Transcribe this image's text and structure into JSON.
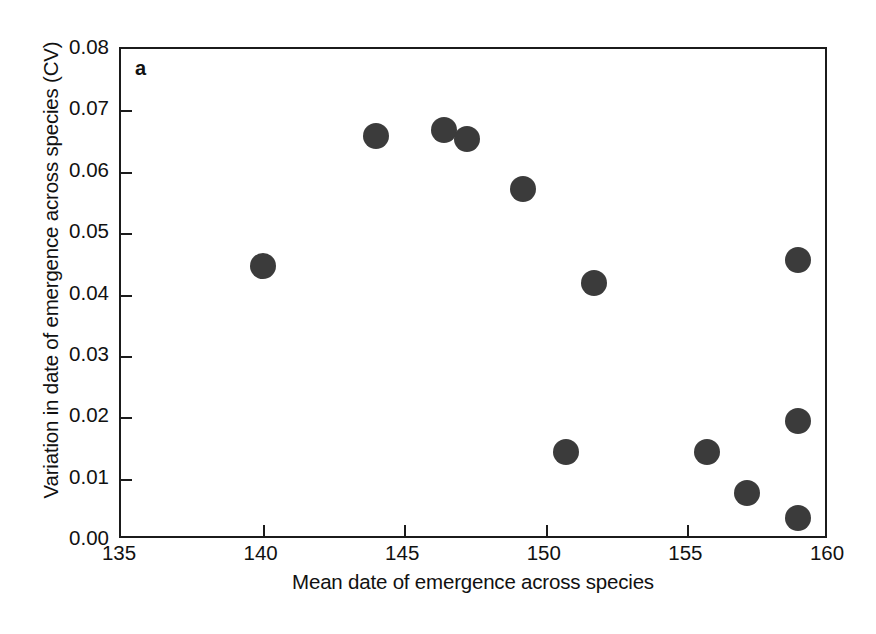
{
  "figure": {
    "panel_label": "a",
    "background_color": "#ffffff",
    "marker_color": "#3b3b3b",
    "axis_color": "#1b1b1b"
  },
  "chart_data": {
    "type": "scatter",
    "title": "",
    "panel": "a",
    "xlabel": "Mean date of emergence across species",
    "ylabel": "Variation in date of emergence across species (CV)",
    "xlim": [
      135,
      160
    ],
    "ylim": [
      0.0,
      0.08
    ],
    "xticks": [
      135,
      140,
      145,
      150,
      155,
      160
    ],
    "xtick_labels": [
      "135",
      "140",
      "145",
      "150",
      "155",
      "160"
    ],
    "yticks": [
      0.0,
      0.01,
      0.02,
      0.03,
      0.04,
      0.05,
      0.06,
      0.07,
      0.08
    ],
    "ytick_labels": [
      "0.00",
      "0.01",
      "0.02",
      "0.03",
      "0.04",
      "0.05",
      "0.06",
      "0.07",
      "0.08"
    ],
    "grid": false,
    "legend": false,
    "marker": "filled-circle",
    "marker_size_px": 26,
    "n_points": 12,
    "points": [
      {
        "x": 140.0,
        "y": 0.0447
      },
      {
        "x": 144.0,
        "y": 0.0659
      },
      {
        "x": 146.4,
        "y": 0.0668
      },
      {
        "x": 147.2,
        "y": 0.0653
      },
      {
        "x": 149.2,
        "y": 0.0572
      },
      {
        "x": 150.7,
        "y": 0.0143
      },
      {
        "x": 151.7,
        "y": 0.0419
      },
      {
        "x": 155.7,
        "y": 0.0143
      },
      {
        "x": 157.1,
        "y": 0.0077
      },
      {
        "x": 158.9,
        "y": 0.0456
      },
      {
        "x": 158.9,
        "y": 0.0194
      },
      {
        "x": 158.9,
        "y": 0.0036
      }
    ]
  }
}
